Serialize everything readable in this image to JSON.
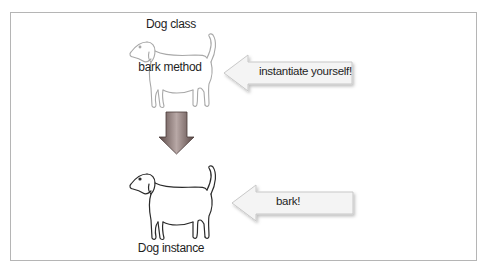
{
  "diagram": {
    "class_label": "Dog class",
    "method_label": "bark method",
    "instance_label": "Dog instance",
    "arrows": [
      {
        "label": "instantiate yourself!",
        "direction": "left",
        "target": "Dog class"
      },
      {
        "label": "bark!",
        "direction": "left",
        "target": "Dog instance"
      }
    ],
    "transition_arrow": {
      "direction": "down",
      "color_edge": "#5a4846",
      "color_center": "#b8a8a6"
    },
    "icons": [
      "dog-class-icon",
      "dog-instance-icon"
    ],
    "colors": {
      "frame_border": "#b5b5b5",
      "callout_fill": "#f4f4f4",
      "callout_stroke": "#c8c8c8",
      "dog_class_stroke": "#a8a8a8",
      "dog_instance_stroke": "#2a2a2a"
    }
  }
}
